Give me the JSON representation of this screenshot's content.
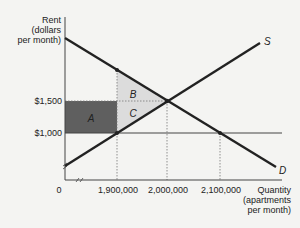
{
  "diagram": {
    "y_axis_label": [
      "Rent",
      "(dollars",
      "per month)"
    ],
    "x_axis_label": [
      "Quantity",
      "(apartments",
      "per month)"
    ],
    "origin_label": "0",
    "y_ticks": [
      "$1,500",
      "$1,000"
    ],
    "x_ticks": [
      "1,900,000",
      "2,000,000",
      "2,100,000"
    ],
    "curves": {
      "supply": "S",
      "demand": "D"
    },
    "regions": {
      "a": "A",
      "b": "B",
      "c": "C"
    },
    "colors": {
      "background": "#f4f4f2",
      "curve": "#222222",
      "region_a": "#5f5f5f",
      "region_bc": "#dcdcdc",
      "guide": "#777777"
    }
  }
}
